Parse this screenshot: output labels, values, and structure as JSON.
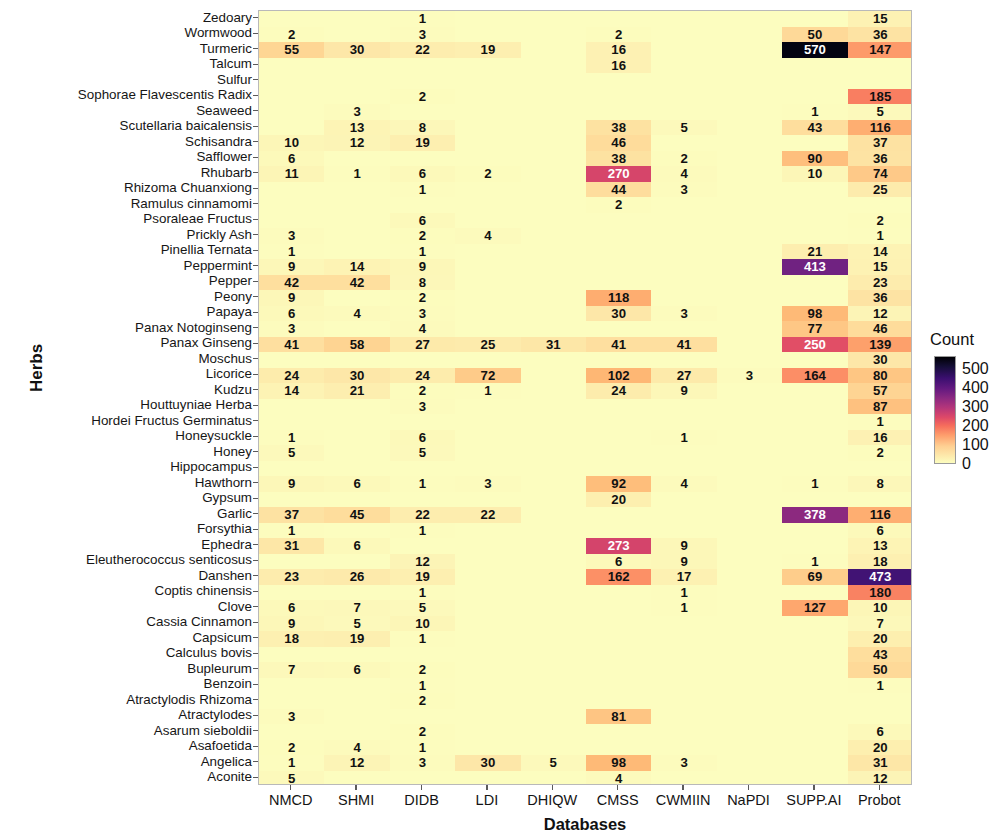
{
  "axes": {
    "ylabel": "Herbs",
    "xlabel": "Databases"
  },
  "legend": {
    "title": "Count",
    "ticks": [
      "500",
      "400",
      "300",
      "200",
      "100",
      "0"
    ],
    "colormap": "inferno-reversed",
    "vmin": 0,
    "vmax": 570
  },
  "chart_data": {
    "type": "heatmap",
    "title": "",
    "xlabel": "Databases",
    "ylabel": "Herbs",
    "colorbar_label": "Count",
    "colorbar_ticks": [
      0,
      100,
      200,
      300,
      400,
      500
    ],
    "vmin": 0,
    "vmax": 570,
    "grid": false,
    "legend_position": "right",
    "columns": [
      "NMCD",
      "SHMI",
      "DIDB",
      "LDI",
      "DHIQW",
      "CMSS",
      "CWMIIN",
      "NaPDI",
      "SUPP.AI",
      "Probot"
    ],
    "rows": [
      "Zedoary",
      "Wormwood",
      "Turmeric",
      "Talcum",
      "Sulfur",
      "Sophorae Flavescentis Radix",
      "Seaweed",
      "Scutellaria baicalensis",
      "Schisandra",
      "Safflower",
      "Rhubarb",
      "Rhizoma Chuanxiong",
      "Ramulus cinnamomi",
      "Psoraleae Fructus",
      "Prickly Ash",
      "Pinellia Ternata",
      "Peppermint",
      "Pepper",
      "Peony",
      "Papaya",
      "Panax Notoginseng",
      "Panax Ginseng",
      "Moschus",
      "Licorice",
      "Kudzu",
      "Houttuyniae Herba",
      "Hordei Fructus Germinatus",
      "Honeysuckle",
      "Honey",
      "Hippocampus",
      "Hawthorn",
      "Gypsum",
      "Garlic",
      "Forsythia",
      "Ephedra",
      "Eleutherococcus senticosus",
      "Danshen",
      "Coptis chinensis",
      "Clove",
      "Cassia Cinnamon",
      "Capsicum",
      "Calculus bovis",
      "Bupleurum",
      "Benzoin",
      "Atractylodis Rhizoma",
      "Atractylodes",
      "Asarum sieboldii",
      "Asafoetida",
      "Angelica",
      "Aconite"
    ],
    "values": [
      [
        null,
        null,
        1,
        null,
        null,
        null,
        null,
        null,
        null,
        15
      ],
      [
        2,
        null,
        3,
        null,
        null,
        2,
        null,
        null,
        50,
        36
      ],
      [
        55,
        30,
        22,
        19,
        null,
        16,
        null,
        null,
        570,
        147
      ],
      [
        null,
        null,
        null,
        null,
        null,
        16,
        null,
        null,
        null,
        null
      ],
      [
        null,
        null,
        null,
        null,
        null,
        null,
        null,
        null,
        null,
        null
      ],
      [
        null,
        null,
        2,
        null,
        null,
        null,
        null,
        null,
        null,
        185
      ],
      [
        null,
        3,
        null,
        null,
        null,
        null,
        null,
        null,
        1,
        5
      ],
      [
        null,
        13,
        8,
        null,
        null,
        38,
        5,
        null,
        43,
        116
      ],
      [
        10,
        12,
        19,
        null,
        null,
        46,
        null,
        null,
        null,
        37
      ],
      [
        6,
        null,
        null,
        null,
        null,
        38,
        2,
        null,
        90,
        36
      ],
      [
        11,
        1,
        6,
        2,
        null,
        270,
        4,
        null,
        10,
        74
      ],
      [
        null,
        null,
        1,
        null,
        null,
        44,
        3,
        null,
        null,
        25
      ],
      [
        null,
        null,
        null,
        null,
        null,
        2,
        null,
        null,
        null,
        null
      ],
      [
        null,
        null,
        6,
        null,
        null,
        null,
        null,
        null,
        null,
        2
      ],
      [
        3,
        null,
        2,
        4,
        null,
        null,
        null,
        null,
        null,
        1
      ],
      [
        1,
        null,
        1,
        null,
        null,
        null,
        null,
        null,
        21,
        14
      ],
      [
        9,
        14,
        9,
        null,
        null,
        null,
        null,
        null,
        413,
        15
      ],
      [
        42,
        42,
        8,
        null,
        null,
        null,
        null,
        null,
        null,
        23
      ],
      [
        9,
        null,
        2,
        null,
        null,
        118,
        null,
        null,
        null,
        36
      ],
      [
        6,
        4,
        3,
        null,
        null,
        30,
        3,
        null,
        98,
        12
      ],
      [
        3,
        null,
        4,
        null,
        null,
        null,
        null,
        null,
        77,
        46
      ],
      [
        41,
        58,
        27,
        25,
        31,
        41,
        41,
        null,
        250,
        139
      ],
      [
        null,
        null,
        null,
        null,
        null,
        null,
        null,
        null,
        null,
        30
      ],
      [
        24,
        30,
        24,
        72,
        null,
        102,
        27,
        3,
        164,
        80
      ],
      [
        14,
        21,
        2,
        1,
        null,
        24,
        9,
        null,
        null,
        57
      ],
      [
        null,
        null,
        3,
        null,
        null,
        null,
        null,
        null,
        null,
        87
      ],
      [
        null,
        null,
        null,
        null,
        null,
        null,
        null,
        null,
        null,
        1
      ],
      [
        1,
        null,
        6,
        null,
        null,
        null,
        1,
        null,
        null,
        16
      ],
      [
        5,
        null,
        5,
        null,
        null,
        null,
        null,
        null,
        null,
        2
      ],
      [
        null,
        null,
        null,
        null,
        null,
        null,
        null,
        null,
        null,
        null
      ],
      [
        9,
        6,
        1,
        3,
        null,
        92,
        4,
        null,
        1,
        8
      ],
      [
        null,
        null,
        null,
        null,
        null,
        20,
        null,
        null,
        null,
        null
      ],
      [
        37,
        45,
        22,
        22,
        null,
        null,
        null,
        null,
        378,
        116
      ],
      [
        1,
        null,
        1,
        null,
        null,
        null,
        null,
        null,
        null,
        6
      ],
      [
        31,
        6,
        null,
        null,
        null,
        273,
        9,
        null,
        null,
        13
      ],
      [
        null,
        null,
        12,
        null,
        null,
        6,
        9,
        null,
        1,
        18
      ],
      [
        23,
        26,
        19,
        null,
        null,
        162,
        17,
        null,
        69,
        473
      ],
      [
        null,
        null,
        1,
        null,
        null,
        null,
        1,
        null,
        null,
        180
      ],
      [
        6,
        7,
        5,
        null,
        null,
        null,
        1,
        null,
        127,
        10
      ],
      [
        9,
        5,
        10,
        null,
        null,
        null,
        null,
        null,
        null,
        7
      ],
      [
        18,
        19,
        1,
        null,
        null,
        null,
        null,
        null,
        null,
        20
      ],
      [
        null,
        null,
        null,
        null,
        null,
        null,
        null,
        null,
        null,
        43
      ],
      [
        7,
        6,
        2,
        null,
        null,
        null,
        null,
        null,
        null,
        50
      ],
      [
        null,
        null,
        1,
        null,
        null,
        null,
        null,
        null,
        null,
        1
      ],
      [
        null,
        null,
        2,
        null,
        null,
        null,
        null,
        null,
        null,
        null
      ],
      [
        3,
        null,
        null,
        null,
        null,
        81,
        null,
        null,
        null,
        null
      ],
      [
        null,
        null,
        2,
        null,
        null,
        null,
        null,
        null,
        null,
        6
      ],
      [
        2,
        4,
        1,
        null,
        null,
        null,
        null,
        null,
        null,
        20
      ],
      [
        1,
        12,
        3,
        30,
        5,
        98,
        3,
        null,
        null,
        31
      ],
      [
        5,
        null,
        null,
        null,
        null,
        4,
        null,
        null,
        null,
        12
      ]
    ]
  }
}
